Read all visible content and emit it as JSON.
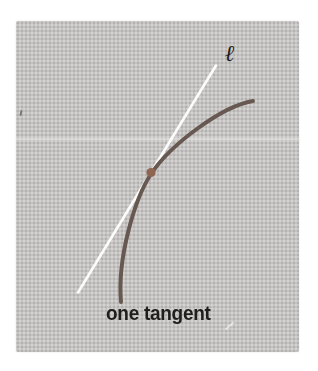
{
  "figure": {
    "caption": "one tangent",
    "line_label": "ℓ",
    "background_color": "#c6c4c2",
    "page_background": "#ffffff",
    "text_color": "#1f1e1d"
  },
  "diagram": {
    "curve_color": "#675952",
    "curve_path": "M 121 302 C 117 258 135 198 151 174 C 170 145 222 106 253 101",
    "tangent_line_color": "#ffffff",
    "tangent_line": {
      "x1": 78,
      "y1": 292.5,
      "x2": 216,
      "y2": 65.5
    },
    "tangent_point": {
      "cx": 151,
      "cy": 172.5,
      "r": 4.6,
      "color": "#8f6450"
    }
  }
}
